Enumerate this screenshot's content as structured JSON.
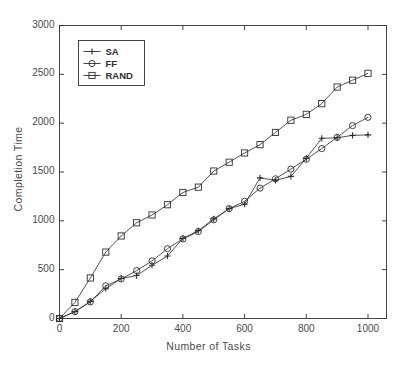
{
  "chart_data": {
    "type": "line",
    "title": "",
    "xlabel": "Number of Tasks",
    "ylabel": "Completion Time",
    "xlim": [
      0,
      1060
    ],
    "ylim": [
      0,
      3000
    ],
    "xticks": [
      0,
      200,
      400,
      600,
      800,
      1000
    ],
    "xtick_labels": [
      "0",
      "200",
      "400",
      "600",
      "800",
      "1000"
    ],
    "yticks": [
      0,
      500,
      1000,
      1500,
      2000,
      2500,
      3000
    ],
    "ytick_labels": [
      "0",
      "500",
      "1000",
      "1500",
      "2000",
      "2500",
      "3000"
    ],
    "grid": false,
    "legend_position": "upper left",
    "x": [
      0,
      50,
      100,
      150,
      200,
      250,
      300,
      350,
      400,
      450,
      500,
      550,
      600,
      650,
      700,
      750,
      800,
      850,
      900,
      950,
      1000
    ],
    "series": [
      {
        "name": "SA",
        "marker": "plus",
        "color": "#333333",
        "values": [
          0,
          70,
          175,
          305,
          410,
          440,
          545,
          640,
          820,
          900,
          1020,
          1125,
          1170,
          1440,
          1415,
          1455,
          1640,
          1845,
          1850,
          1875,
          1880
        ]
      },
      {
        "name": "FF",
        "marker": "circle",
        "color": "#333333",
        "values": [
          0,
          70,
          170,
          335,
          405,
          490,
          590,
          715,
          815,
          890,
          1010,
          1125,
          1200,
          1335,
          1430,
          1530,
          1630,
          1740,
          1855,
          1975,
          2060
        ]
      },
      {
        "name": "RAND",
        "marker": "square",
        "color": "#333333",
        "values": [
          0,
          165,
          415,
          680,
          845,
          980,
          1060,
          1165,
          1290,
          1345,
          1510,
          1600,
          1695,
          1780,
          1905,
          2030,
          2090,
          2200,
          2370,
          2440,
          2510
        ]
      }
    ]
  },
  "legend": {
    "items": [
      {
        "label": "SA"
      },
      {
        "label": "FF"
      },
      {
        "label": "RAND"
      }
    ]
  }
}
